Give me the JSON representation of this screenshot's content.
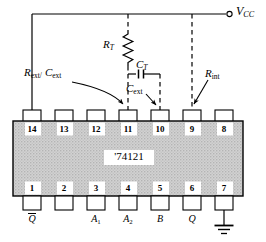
{
  "diagram": {
    "chip": {
      "part_label": "'74121",
      "package": "DIP-14",
      "body_fill": "#cfcfcf",
      "line_color": "#000000"
    },
    "supply": {
      "label_main": "V",
      "label_sub": "CC",
      "terminal": "open-circle"
    },
    "components": [
      {
        "id": "rt",
        "name": "resistor-rt",
        "label_main": "R",
        "label_sub": "T",
        "type": "resistor"
      },
      {
        "id": "ct",
        "name": "capacitor-ct",
        "label_main": "C",
        "label_sub": "T",
        "type": "capacitor"
      },
      {
        "id": "rext",
        "name": "label-rext-cext",
        "label_main": "R",
        "label_sub": "ext/",
        "label_main2": "C",
        "label_sub2": "ext",
        "type": "annotation"
      },
      {
        "id": "cext",
        "name": "label-cext",
        "label_main": "C",
        "label_sub": "ext",
        "type": "annotation"
      },
      {
        "id": "rint",
        "name": "label-rint",
        "label_main": "R",
        "label_sub": "int",
        "type": "annotation"
      }
    ],
    "pins_top": [
      {
        "number": "14",
        "x": 32,
        "net": "vcc-solid"
      },
      {
        "number": "13",
        "x": 64,
        "net": "none"
      },
      {
        "number": "12",
        "x": 96,
        "net": "none"
      },
      {
        "number": "11",
        "x": 128,
        "net": "rt-dashed"
      },
      {
        "number": "10",
        "x": 160,
        "net": "ct-dashed"
      },
      {
        "number": "9",
        "x": 192,
        "net": "vcc-dashed"
      },
      {
        "number": "8",
        "x": 224,
        "net": "none"
      }
    ],
    "pins_bottom": [
      {
        "number": "1",
        "x": 32,
        "label_main": "Q",
        "label_sub": "",
        "overline": true,
        "ground": false
      },
      {
        "number": "2",
        "x": 64,
        "label_main": "",
        "label_sub": "",
        "overline": false,
        "ground": false
      },
      {
        "number": "3",
        "x": 96,
        "label_main": "A",
        "label_sub": "1",
        "overline": false,
        "ground": false
      },
      {
        "number": "4",
        "x": 128,
        "label_main": "A",
        "label_sub": "2",
        "overline": false,
        "ground": false
      },
      {
        "number": "5",
        "x": 160,
        "label_main": "B",
        "label_sub": "",
        "overline": false,
        "ground": false
      },
      {
        "number": "6",
        "x": 192,
        "label_main": "Q",
        "label_sub": "",
        "overline": false,
        "ground": false
      },
      {
        "number": "7",
        "x": 224,
        "label_main": "",
        "label_sub": "",
        "overline": false,
        "ground": true
      }
    ]
  }
}
